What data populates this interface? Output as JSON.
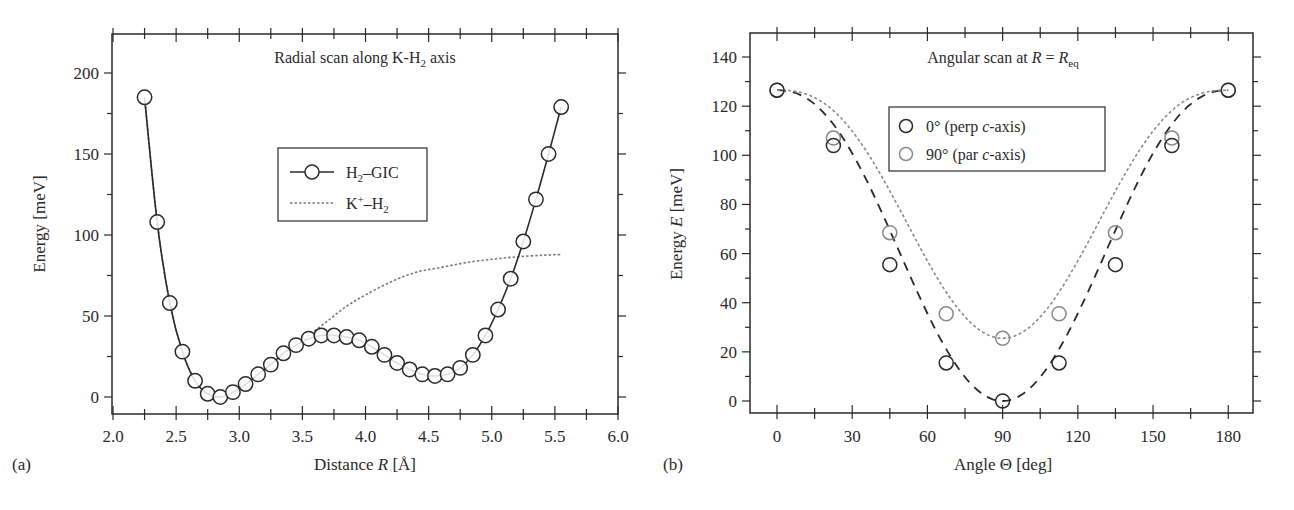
{
  "chart_data": [
    {
      "panel": "(a)",
      "type": "line",
      "title": "Radial scan along K-H₂ axis",
      "xlabel": "Distance R [Å]",
      "ylabel": "Energy [meV]",
      "xlim": [
        2.0,
        6.0
      ],
      "ylim": [
        -10,
        224
      ],
      "xticks": [
        "2.0",
        "2.5",
        "3.0",
        "3.5",
        "4.0",
        "4.5",
        "5.0",
        "5.5",
        "6.0"
      ],
      "yticks": [
        "0",
        "50",
        "100",
        "150",
        "200"
      ],
      "grid": false,
      "legend_position": "center",
      "series": [
        {
          "name": "H₂–GIC",
          "style": "solid line with open circle markers",
          "color": "#2a2a2a",
          "x": [
            2.25,
            2.35,
            2.45,
            2.55,
            2.65,
            2.75,
            2.85,
            2.95,
            3.05,
            3.15,
            3.25,
            3.35,
            3.45,
            3.55,
            3.65,
            3.75,
            3.85,
            3.95,
            4.05,
            4.15,
            4.25,
            4.35,
            4.45,
            4.55,
            4.65,
            4.75,
            4.85,
            4.95,
            5.05,
            5.15,
            5.25,
            5.35,
            5.45,
            5.55
          ],
          "values": [
            185,
            108,
            58,
            28,
            10,
            2,
            0,
            3,
            8,
            14,
            20,
            27,
            32,
            36,
            38,
            38,
            37,
            35,
            31,
            26,
            21,
            17,
            14,
            13,
            14,
            18,
            26,
            38,
            54,
            73,
            96,
            122,
            150,
            179
          ]
        },
        {
          "name": "K⁺–H₂",
          "style": "dotted line",
          "color": "#7a7a7a",
          "x": [
            2.25,
            2.35,
            2.45,
            2.55,
            2.65,
            2.75,
            2.85,
            2.95,
            3.05,
            3.15,
            3.25,
            3.35,
            3.45,
            3.55,
            3.7,
            3.85,
            4.0,
            4.2,
            4.4,
            4.6,
            4.8,
            5.0,
            5.2,
            5.4,
            5.55
          ],
          "values": [
            185,
            108,
            58,
            28,
            10,
            2,
            0,
            3,
            8,
            14,
            20,
            27,
            32,
            38,
            47,
            56,
            63,
            71,
            77,
            80,
            83,
            85,
            86.5,
            87.5,
            88
          ]
        }
      ],
      "legend": [
        {
          "label_main": "H",
          "label_sub": "2",
          "label_rest": "–GIC",
          "marker": "circle-line"
        },
        {
          "label_main": "K",
          "label_sup": "+",
          "label_rest": "–H",
          "label_sub": "2",
          "marker": "dotted-line"
        }
      ]
    },
    {
      "panel": "(b)",
      "type": "scatter",
      "title": "Angular scan at R = R_eq",
      "xlabel": "Angle Θ [deg]",
      "ylabel": "Energy E [meV]",
      "xlim": [
        -10.8,
        190
      ],
      "ylim": [
        -4.9,
        149.7
      ],
      "xticks": [
        "0",
        "30",
        "60",
        "90",
        "120",
        "150",
        "180"
      ],
      "yticks": [
        "0",
        "20",
        "40",
        "60",
        "80",
        "100",
        "120",
        "140"
      ],
      "grid": false,
      "legend_position": "upper center",
      "series": [
        {
          "name": "0° (perp c-axis)",
          "style": "open circles with long-dashed fit curve",
          "color": "#2a2a2a",
          "x": [
            0,
            22.5,
            45,
            67.5,
            90,
            112.5,
            135,
            157.5,
            180
          ],
          "values": [
            126.5,
            104,
            55.5,
            15.5,
            0,
            15.5,
            55.5,
            104,
            126.5
          ]
        },
        {
          "name": "90° (par c-axis)",
          "style": "open circles with short-dotted fit curve",
          "color": "#8a8a8a",
          "x": [
            0,
            22.5,
            45,
            67.5,
            90,
            112.5,
            135,
            157.5,
            180
          ],
          "values": [
            126.5,
            107,
            68.5,
            35.5,
            25.5,
            35.5,
            68.5,
            107,
            126.5
          ]
        }
      ]
    }
  ],
  "panel_a": {
    "label": "(a)",
    "title_prefix": "Radial scan along K-H",
    "title_sub": "2",
    "title_suffix": " axis",
    "xlabel_prefix": "Distance ",
    "xlabel_var": "R",
    "xlabel_suffix": " [Å]",
    "ylabel": "Energy [meV]",
    "legend1": {
      "main": "H",
      "sub": "2",
      "rest": "–GIC"
    },
    "legend2": {
      "main": "K",
      "sup": "+",
      "rest": "–H",
      "sub": "2"
    }
  },
  "panel_b": {
    "label": "(b)",
    "title_prefix": "Angular scan at ",
    "title_var": "R",
    "title_eq": " = ",
    "title_var2": "R",
    "title_sub": "eq",
    "xlabel": "Angle Θ [deg]",
    "ylabel_prefix": "Energy ",
    "ylabel_var": "E",
    "ylabel_suffix": " [meV]",
    "legend1": {
      "prefix": "0° (perp ",
      "var": "c",
      "suffix": "-axis)"
    },
    "legend2": {
      "prefix": "90° (par ",
      "var": "c",
      "suffix": "-axis)"
    }
  }
}
